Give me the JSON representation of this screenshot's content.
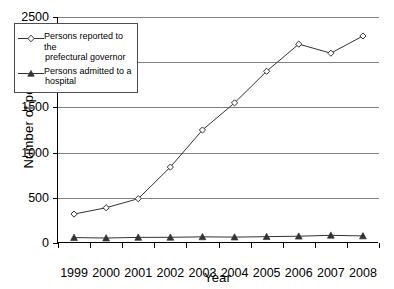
{
  "chart_data": {
    "type": "line",
    "title": "",
    "xlabel": "Year",
    "ylabel": "Number of persons",
    "categories": [
      "1999",
      "2000",
      "2001",
      "2002",
      "2003",
      "2004",
      "2005",
      "2006",
      "2007",
      "2008"
    ],
    "ylim": [
      0,
      2500
    ],
    "yticks": [
      0,
      500,
      1000,
      1500,
      2000,
      2500
    ],
    "ytick_labels": [
      "0",
      "500",
      "1000",
      "1500",
      "2000",
      "2500"
    ],
    "grid": "horizontal",
    "legend_position": "upper-left-inside",
    "series": [
      {
        "name": "Persons reported to the prefectural governor",
        "name_line1": "Persons reported to the",
        "name_line2": "prefectural governor",
        "marker": "open-diamond",
        "color": "#333333",
        "values": [
          320,
          390,
          490,
          840,
          1250,
          1550,
          1900,
          2200,
          2100,
          2290
        ]
      },
      {
        "name": "Persons admitted to a hospital",
        "name_line1": "Persons admitted to a",
        "name_line2": "hospital",
        "marker": "filled-triangle",
        "color": "#333333",
        "values": [
          60,
          55,
          62,
          63,
          68,
          65,
          70,
          75,
          85,
          78
        ]
      }
    ]
  }
}
